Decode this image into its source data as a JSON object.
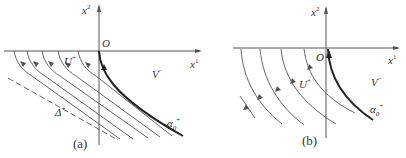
{
  "figure": {
    "panels": [
      {
        "id": "a",
        "caption": "(a)",
        "axis_x_label": "x",
        "axis_x_sup": "1",
        "axis_y_label": "x",
        "axis_y_sup": "2",
        "origin_label": "O",
        "region_left_label": "U",
        "region_left_sup": "+",
        "region_right_label": "V",
        "region_right_sup": "−",
        "curve_label": "α",
        "curve_sub": "0",
        "curve_sup": "+",
        "dashed_label": "Δ",
        "dashed_sup": "+"
      },
      {
        "id": "b",
        "caption": "(b)",
        "axis_x_label": "x",
        "axis_x_sup": "1",
        "axis_y_label": "x",
        "axis_y_sup": "2",
        "origin_label": "O",
        "region_left_label": "U",
        "region_left_sup": "+",
        "region_right_label": "V",
        "region_right_sup": "−",
        "curve_label": "α",
        "curve_sub": "0",
        "curve_sup": "+"
      }
    ],
    "colors": {
      "line": "#555555",
      "bold_curve": "#222222",
      "text": "#333333"
    }
  }
}
